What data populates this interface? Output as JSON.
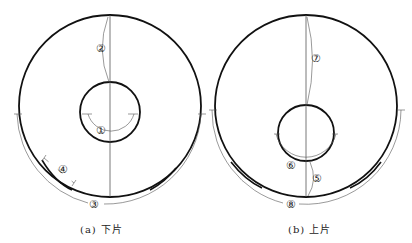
{
  "figure": {
    "panels": [
      {
        "id": "a",
        "caption": "(a) 下片",
        "labels": {
          "1": "①",
          "2": "②",
          "3": "③",
          "4": "④"
        }
      },
      {
        "id": "b",
        "caption": "(b) 上片",
        "labels": {
          "5": "⑤",
          "6": "⑥",
          "7": "⑦",
          "8": "⑧"
        }
      }
    ],
    "colors": {
      "stroke": "#111111",
      "thin": "#555555",
      "background": "#ffffff"
    }
  }
}
